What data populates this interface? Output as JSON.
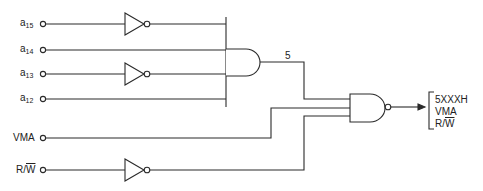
{
  "diagram": {
    "type": "logic-circuit",
    "inputs": [
      {
        "id": "a15",
        "base": "a",
        "sub": "15",
        "inverted": true
      },
      {
        "id": "a14",
        "base": "a",
        "sub": "14",
        "inverted": false
      },
      {
        "id": "a13",
        "base": "a",
        "sub": "13",
        "inverted": true
      },
      {
        "id": "a12",
        "base": "a",
        "sub": "12",
        "inverted": false
      },
      {
        "id": "VMA",
        "base": "VMA",
        "sub": "",
        "inverted": false
      },
      {
        "id": "RW",
        "base": "R/",
        "overline": "W",
        "inverted": true
      }
    ],
    "gates": [
      {
        "id": "and4",
        "type": "AND",
        "inputs": [
          "a15'",
          "a14",
          "a13'",
          "a12"
        ],
        "output_label": "5"
      },
      {
        "id": "nand3",
        "type": "NAND",
        "inputs": [
          "and4",
          "VMA",
          "R/W'"
        ]
      }
    ],
    "and_output_label": "5",
    "output": {
      "lines": [
        "5XXXH",
        "VMA",
        "R/"
      ],
      "overline_last": "W"
    },
    "colors": {
      "line": "#2a2a2a",
      "background": "#ffffff"
    }
  }
}
